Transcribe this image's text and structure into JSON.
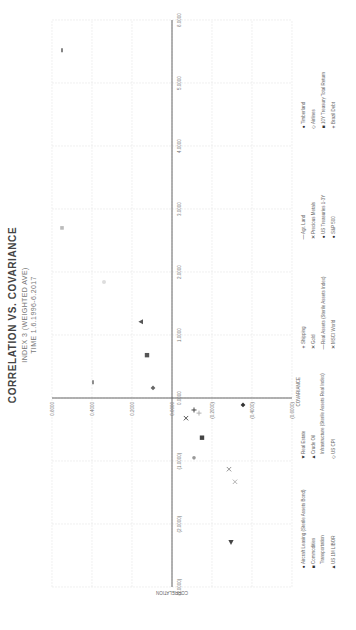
{
  "chart_data": {
    "type": "scatter",
    "title": "CORRELATION VS. COVARIANCE",
    "subtitle": "INDEX 3 (WEIGHTED AVE)",
    "subtitle2": "TIME 1.6.1996-6.2017",
    "xlabel": "COVARIANCE",
    "ylabel": "CORRELATION",
    "xlim": [
      -3.0,
      6.0
    ],
    "ylim": [
      -0.6,
      0.6
    ],
    "x_ticks": [
      "(3.0000)",
      "(2.0000)",
      "(1.0000)",
      "0.0000",
      "1.0000",
      "2.0000",
      "3.0000",
      "4.0000",
      "5.0000",
      "6.0000"
    ],
    "y_ticks": [
      "0.6000",
      "0.4000",
      "0.2000",
      "0.0000",
      "(0.2000)",
      "(0.4000)",
      "(0.6000)"
    ],
    "grid": true,
    "legend_position": "bottom",
    "points": [
      {
        "x": 5.52,
        "y": 0.55,
        "marker": "dash",
        "color": "#333333"
      },
      {
        "x": 2.7,
        "y": 0.55,
        "marker": "square-light",
        "color": "#bbbbbb"
      },
      {
        "x": 1.84,
        "y": 0.34,
        "marker": "circle-faint",
        "color": "#dddddd"
      },
      {
        "x": 1.21,
        "y": 0.155,
        "marker": "triangle",
        "color": "#555555"
      },
      {
        "x": 0.68,
        "y": 0.125,
        "marker": "square",
        "color": "#555555"
      },
      {
        "x": 0.25,
        "y": 0.395,
        "marker": "dash",
        "color": "#444444"
      },
      {
        "x": 0.16,
        "y": 0.095,
        "marker": "diamond",
        "color": "#666666"
      },
      {
        "x": -0.11,
        "y": -0.355,
        "marker": "diamond",
        "color": "#333333"
      },
      {
        "x": -0.19,
        "y": -0.11,
        "marker": "plus",
        "color": "#333333"
      },
      {
        "x": -0.24,
        "y": -0.135,
        "marker": "plus",
        "color": "#aaaaaa"
      },
      {
        "x": -0.32,
        "y": -0.07,
        "marker": "x",
        "color": "#444444"
      },
      {
        "x": -0.63,
        "y": -0.15,
        "marker": "square",
        "color": "#444444"
      },
      {
        "x": -0.95,
        "y": -0.11,
        "marker": "circle",
        "color": "#999999"
      },
      {
        "x": -1.13,
        "y": -0.285,
        "marker": "x",
        "color": "#888888"
      },
      {
        "x": -1.33,
        "y": -0.315,
        "marker": "x",
        "color": "#aaaaaa"
      },
      {
        "x": -2.29,
        "y": -0.295,
        "marker": "triangle-left",
        "color": "#444444"
      }
    ],
    "legend": [
      [
        "Aircraft Leasing (Sterile Assets Bond)",
        "Real Estate",
        "Shipping",
        "Agr. Land",
        "Timberland"
      ],
      [
        "Commodities",
        "Crude Oil",
        "Gold",
        "Precious Metals",
        "Airlines"
      ],
      [
        "Transportation",
        "Infrastructure (Sterile Assets Real Index)",
        "Real Assets (Sterile Assets Index)",
        "US Treasuries 1-3Y",
        "10Y Treasury Total Return"
      ],
      [
        "US 1M LIBOR",
        "US CPI",
        "MSCI World",
        "S&P 500",
        "Brazil Debt"
      ]
    ],
    "legend_symbols": [
      [
        "●",
        "▼",
        "+",
        "—",
        "●"
      ],
      [
        "■",
        "▲",
        "✕",
        "✕",
        "◇"
      ],
      [
        "",
        "",
        "—",
        "●",
        "■"
      ],
      [
        "▲",
        "◇",
        "✕",
        "●",
        "+"
      ]
    ]
  }
}
